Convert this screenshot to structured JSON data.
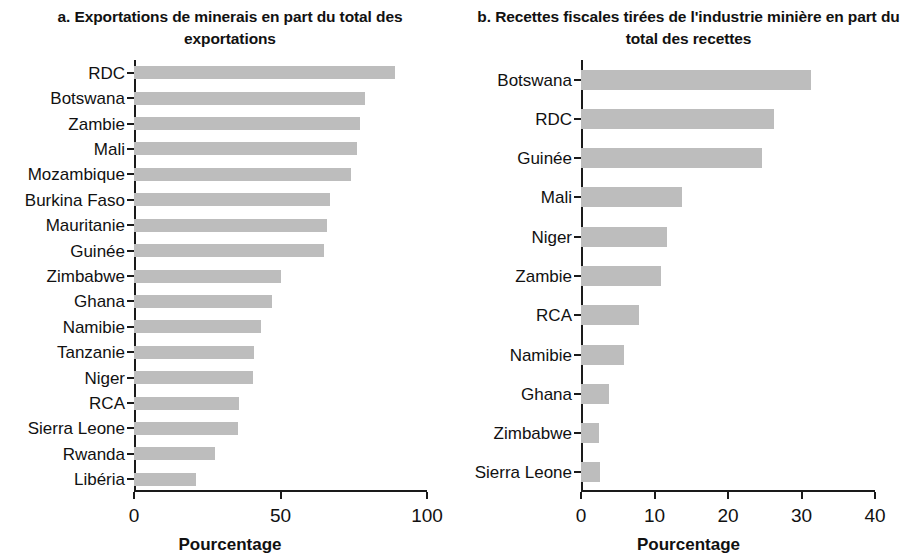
{
  "panels": [
    {
      "id": "a",
      "title": "a. Exportations de minerais en part du total des exportations",
      "xlabel": "Pourcentage"
    },
    {
      "id": "b",
      "title": "b. Recettes fiscales tirées de l'industrie minière en part du total des recettes",
      "xlabel": "Pourcentage"
    }
  ],
  "colors": {
    "bar": "#bdbdbd",
    "axis": "#1a1a1a",
    "text": "#111111"
  },
  "chart_data": [
    {
      "type": "bar",
      "orientation": "horizontal",
      "title": "a. Exportations de minerais en part du total des exportations",
      "xlabel": "Pourcentage",
      "ylabel": "",
      "xlim": [
        0,
        100
      ],
      "xticks": [
        0,
        50,
        100
      ],
      "xticklabels": [
        "0",
        "50",
        "100"
      ],
      "grid": false,
      "legend": false,
      "categories": [
        "RDC",
        "Botswana",
        "Zambie",
        "Mali",
        "Mozambique",
        "Burkina Faso",
        "Mauritanie",
        "Guinée",
        "Zimbabwe",
        "Ghana",
        "Namibie",
        "Tanzanie",
        "Niger",
        "RCA",
        "Sierra Leone",
        "Rwanda",
        "Libéria"
      ],
      "values": [
        89,
        79,
        77,
        76,
        74,
        67,
        66,
        65,
        50,
        47,
        43.5,
        41,
        40.5,
        36,
        35.5,
        27.5,
        21
      ]
    },
    {
      "type": "bar",
      "orientation": "horizontal",
      "title": "b. Recettes fiscales tirées de l'industrie minière en part du total des recettes",
      "xlabel": "Pourcentage",
      "ylabel": "",
      "xlim": [
        0,
        40
      ],
      "xticks": [
        0,
        10,
        20,
        30,
        40
      ],
      "xticklabels": [
        "0",
        "10",
        "20",
        "30",
        "40"
      ],
      "grid": false,
      "legend": false,
      "categories": [
        "Botswana",
        "RDC",
        "Guinée",
        "Mali",
        "Niger",
        "Zambie",
        "RCA",
        "Namibie",
        "Ghana",
        "Zimbabwe",
        "Sierra Leone"
      ],
      "values": [
        31.3,
        26.3,
        24.6,
        13.8,
        11.7,
        10.9,
        7.9,
        5.8,
        3.8,
        2.5,
        2.6
      ]
    }
  ]
}
